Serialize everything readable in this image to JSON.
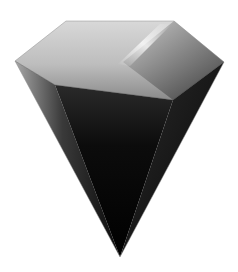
{
  "image": {
    "subject": "diamond-gem",
    "description": "Grayscale 3D-rendered diamond gem with a light crown and dark pavilion tapering to a point",
    "background": "#ffffff",
    "colors": {
      "crown_light": "#e6e6e6",
      "crown_mid": "#b4b4b4",
      "highlight": "#f4f4f4",
      "pavilion_left": "#9a9a9a",
      "pavilion_dark": "#050505",
      "edge": "#8c8c8c"
    }
  }
}
